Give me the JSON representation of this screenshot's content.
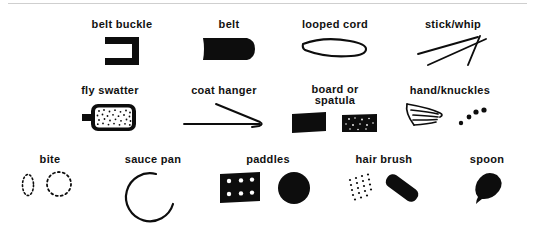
{
  "figure": {
    "background_color": "#ffffff",
    "ink_color": "#0d0d0d",
    "rows": 3,
    "total_items": 13
  },
  "rows": [
    {
      "row_index": 1,
      "items": [
        {
          "label": "belt buckle",
          "icon": "open-bracket-buckle-icon"
        },
        {
          "label": "belt",
          "icon": "solid-belt-strap-icon"
        },
        {
          "label": "looped cord",
          "icon": "elongated-loop-cord-icon"
        },
        {
          "label": "stick/whip",
          "icon": "crossed-sticks-icon"
        }
      ]
    },
    {
      "row_index": 2,
      "items": [
        {
          "label": "fly swatter",
          "icon": "stippled-swatter-paddle-icon"
        },
        {
          "label": "coat hanger",
          "icon": "wire-hanger-triangle-icon"
        },
        {
          "label": "board or\nspatula",
          "icon": "two-dark-boards-icon"
        },
        {
          "label": "hand/knuckles",
          "icon": "open-hand-and-knuckle-dots-icon"
        }
      ]
    },
    {
      "row_index": 3,
      "items": [
        {
          "label": "bite",
          "icon": "dotted-bite-arcs-icon"
        },
        {
          "label": "sauce pan",
          "icon": "open-circle-pan-icon"
        },
        {
          "label": "paddles",
          "icon": "holed-paddle-and-disc-icon"
        },
        {
          "label": "hair brush",
          "icon": "bristle-dots-and-brush-body-icon"
        },
        {
          "label": "spoon",
          "icon": "teardrop-spoon-bowl-icon"
        }
      ]
    }
  ]
}
